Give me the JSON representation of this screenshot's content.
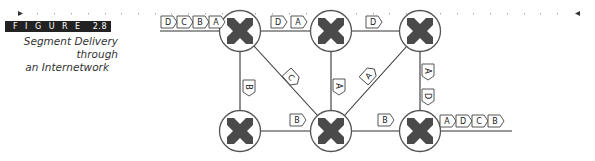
{
  "figure": {
    "label_word": "FIGURE",
    "number": "2.8",
    "caption_line1": "Segment Delivery through",
    "caption_line2": "an Internetwork"
  },
  "diagram": {
    "routers": [
      {
        "id": "r-top-left",
        "x": 240,
        "y": 31
      },
      {
        "id": "r-top-mid",
        "x": 331,
        "y": 31
      },
      {
        "id": "r-top-right",
        "x": 420,
        "y": 31
      },
      {
        "id": "r-bot-left",
        "x": 240,
        "y": 131
      },
      {
        "id": "r-bot-mid",
        "x": 331,
        "y": 131
      },
      {
        "id": "r-bot-right",
        "x": 420,
        "y": 131
      }
    ],
    "packets": {
      "input": [
        "D",
        "C",
        "B",
        "A"
      ],
      "top_left_to_mid": [
        "D",
        "A"
      ],
      "top_mid_to_right": [
        "D"
      ],
      "left_vertical": [
        "B"
      ],
      "diag_left": [
        "C"
      ],
      "mid_vertical": [
        "A"
      ],
      "diag_right": [
        "A"
      ],
      "right_vertical": [
        "A",
        "D"
      ],
      "bottom_left_to_mid": [
        "B"
      ],
      "bottom_mid_to_right": [
        "B"
      ],
      "output": [
        "A",
        "D",
        "C",
        "B"
      ]
    },
    "colors": {
      "router_fill": "#4a4a4a",
      "line": "#333333",
      "ruler_dot": "#999999"
    }
  }
}
